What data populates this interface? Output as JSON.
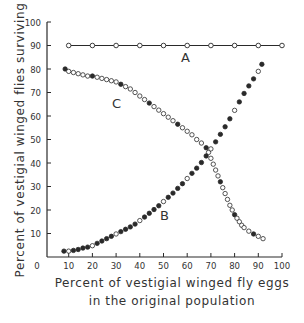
{
  "chart_data": {
    "type": "scatter",
    "title": "",
    "xlabel": "Percent of vestigial winged fly eggs in the original population",
    "xlabel_lines": [
      "Percent of vestigial winged fly eggs",
      "in the original population"
    ],
    "ylabel": "Percent of vestigial winged flies surviving",
    "xlim": [
      0,
      100
    ],
    "ylim": [
      0,
      100
    ],
    "x_ticks": [
      0,
      10,
      20,
      30,
      40,
      50,
      60,
      70,
      80,
      90,
      100
    ],
    "y_ticks": [
      10,
      20,
      30,
      40,
      50,
      60,
      70,
      80,
      90,
      100
    ],
    "grid": false,
    "legend": null,
    "annotations": [
      {
        "text": "A",
        "x": 60,
        "y": 86
      },
      {
        "text": "B",
        "x": 57,
        "y": 18
      },
      {
        "text": "C",
        "x": 29,
        "y": 66
      }
    ],
    "series": [
      {
        "name": "A",
        "style": "open circles connected by line",
        "x": [
          10,
          20,
          30,
          40,
          50,
          60,
          70,
          80,
          90,
          100
        ],
        "y": [
          90,
          90,
          90,
          90,
          90,
          90,
          90,
          90,
          90,
          90
        ]
      },
      {
        "name": "B",
        "style": "mixed filled and open circles",
        "x": [
          8,
          10,
          12,
          14,
          16,
          18,
          20,
          22,
          24,
          26,
          28,
          30,
          32,
          34,
          36,
          38,
          40,
          42,
          44,
          46,
          48,
          50,
          52,
          54,
          56,
          58,
          60,
          62,
          64,
          66,
          68,
          70,
          72,
          74,
          76,
          78,
          80,
          82,
          84,
          86,
          88,
          90,
          91.5
        ],
        "y": [
          2.5,
          2.5,
          2.8,
          3.2,
          3.8,
          4.2,
          4.8,
          5.8,
          6.8,
          7.8,
          8.8,
          9.8,
          10.8,
          11.8,
          12.8,
          14.0,
          15.5,
          17.0,
          18.6,
          20.2,
          21.8,
          23.6,
          25.4,
          27.2,
          29.2,
          31.2,
          33.4,
          35.6,
          37.8,
          40.2,
          43.0,
          46.0,
          49.0,
          52.2,
          55.4,
          58.8,
          62.4,
          66.0,
          69.6,
          72.8,
          75.8,
          79.0,
          82.0
        ]
      },
      {
        "name": "C",
        "style": "mixed filled and open circles",
        "x": [
          8.5,
          10,
          12,
          14,
          16,
          18,
          20,
          22,
          24,
          26,
          28,
          30,
          32,
          34,
          36,
          38,
          40,
          42,
          44,
          46,
          48,
          50,
          52,
          54,
          56,
          58,
          60,
          62,
          64,
          66,
          68,
          69,
          70,
          71,
          72,
          73,
          74,
          75,
          76,
          77,
          78,
          79,
          80,
          81,
          82,
          83,
          84,
          86,
          88,
          90,
          92
        ],
        "y": [
          80,
          79,
          78.5,
          78,
          77.5,
          77,
          77,
          76.5,
          76,
          75.5,
          75,
          74.5,
          73.5,
          72.5,
          71.5,
          70,
          68.5,
          67,
          65.5,
          64,
          62.5,
          61,
          59.5,
          58,
          56.5,
          55,
          53.5,
          52,
          50,
          48.5,
          46.5,
          44.5,
          42,
          39.5,
          37,
          34.5,
          32,
          29.5,
          27,
          24.5,
          22,
          20,
          18,
          16.5,
          15,
          13.5,
          12.5,
          11,
          9.8,
          8.8,
          7.8
        ]
      }
    ]
  },
  "chart": {
    "ylabel": "Percent of vestigial winged flies surviving",
    "xlabel_line1": "Percent of vestigial winged fly eggs",
    "xlabel_line2": "in the original population",
    "label_a": "A",
    "label_b": "B",
    "label_c": "C"
  },
  "colors": {
    "ink": "#2a2a2a",
    "background": "#ffffff"
  }
}
